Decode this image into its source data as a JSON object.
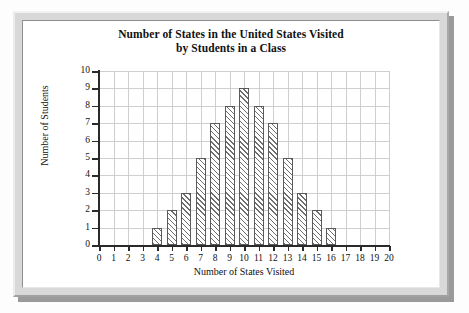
{
  "chart_data": {
    "type": "bar",
    "title": "Number of States in the United States Visited by Students in a Class",
    "title_line1": "Number of States in the United States Visited",
    "title_line2": "by Students in a Class",
    "xlabel": "Number of States Visited",
    "ylabel": "Number of Students",
    "xlim": [
      0,
      20
    ],
    "ylim": [
      0,
      10
    ],
    "grid": true,
    "legend": null,
    "categories": [
      0,
      1,
      2,
      3,
      4,
      5,
      6,
      7,
      8,
      9,
      10,
      11,
      12,
      13,
      14,
      15,
      16,
      17,
      18,
      19,
      20
    ],
    "values": [
      0,
      0,
      0,
      0,
      1,
      2,
      3,
      5,
      7,
      8,
      9,
      8,
      7,
      5,
      3,
      2,
      1,
      0,
      0,
      0,
      0
    ],
    "x_tick_labels": [
      "0",
      "1",
      "2",
      "3",
      "4",
      "5",
      "6",
      "7",
      "8",
      "9",
      "10",
      "11",
      "12",
      "13",
      "14",
      "15",
      "16",
      "17",
      "18",
      "19",
      "20"
    ],
    "y_tick_labels": [
      "0",
      "1",
      "2",
      "3",
      "4",
      "5",
      "6",
      "7",
      "8",
      "9",
      "10"
    ],
    "bar_style": "diagonal-hatch",
    "bar_edge_color": "#5a5a5a",
    "grid_color": "#cfcfcf",
    "axis_color": "#2a2a2a"
  },
  "frame": {
    "border_color": "#d8d8d8",
    "panel_color": "#ffffff"
  }
}
